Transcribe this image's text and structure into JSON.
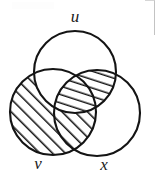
{
  "figure": {
    "kind": "venn-diagram",
    "sets": 3,
    "stroke_color": "#141414",
    "fill_color": "#ffffff",
    "hatch_color": "#141414"
  },
  "labels": {
    "u": "u",
    "v": "v",
    "x": "x"
  },
  "circles": [
    {
      "name": "u",
      "cx": 75,
      "cy": 72,
      "r": 41
    },
    {
      "name": "v",
      "cx": 53,
      "cy": 112,
      "r": 43
    },
    {
      "name": "x",
      "cx": 97,
      "cy": 113,
      "r": 43
    }
  ],
  "regions": [
    {
      "name": "v-only",
      "shaded": true,
      "hatch": "diagonal-45"
    },
    {
      "name": "u-intersect-v",
      "shaded": false,
      "hatch": "none"
    },
    {
      "name": "v-intersect-x",
      "shaded": true,
      "hatch": "diagonal-45"
    },
    {
      "name": "u-intersect-x",
      "shaded": true,
      "hatch": "steep-75"
    },
    {
      "name": "u-v-x",
      "shaded": true,
      "hatch": "steep-75"
    },
    {
      "name": "u-only",
      "shaded": false,
      "hatch": "none"
    },
    {
      "name": "x-only",
      "shaded": false,
      "hatch": "none"
    }
  ]
}
